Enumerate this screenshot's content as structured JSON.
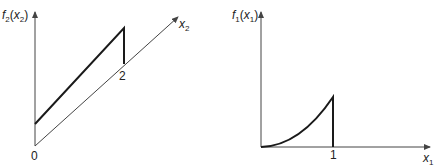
{
  "figure": {
    "left_plot": {
      "y_label": {
        "main": "f",
        "sub": "2",
        "arg_main": "x",
        "arg_sub": "2"
      },
      "x_label": {
        "main": "x",
        "sub": "2"
      },
      "origin_label": "0",
      "tick_label": "2",
      "description": "Linear ramp f2(x2) from positive intercept at x2=0 up to x2=2, then drops to zero (drawn on oblique x2 axis)"
    },
    "right_plot": {
      "y_label": {
        "main": "f",
        "sub": "1",
        "arg_main": "x",
        "arg_sub": "1"
      },
      "x_label": {
        "main": "x",
        "sub": "1"
      },
      "tick_label": "1",
      "description": "Convex curve f1(x1) rising from 0 at x1=0 to a maximum at x1=1, then drops to zero"
    },
    "colors": {
      "axis": "#444444",
      "curve": "#1a1a1a",
      "background": "#ffffff"
    }
  }
}
